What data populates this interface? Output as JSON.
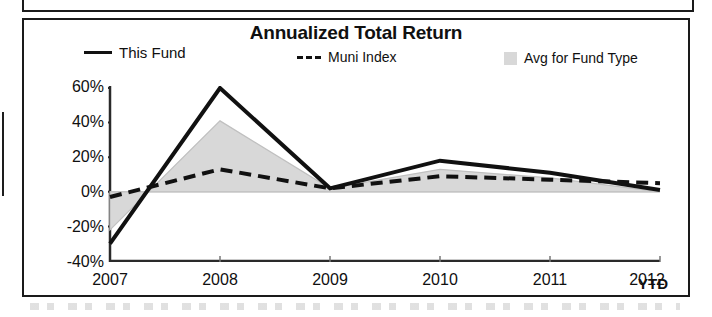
{
  "chart_data": {
    "type": "line",
    "title": "Annualized Total Return",
    "xlabel": "",
    "ylabel": "",
    "categories": [
      "2007",
      "2008",
      "2009",
      "2010",
      "2011",
      "2012"
    ],
    "x_axis_suffix": "YTD",
    "ytick_labels": [
      "60%",
      "40%",
      "20%",
      "0%",
      "-20%",
      "-40%"
    ],
    "ytick_values": [
      60,
      40,
      20,
      0,
      -20,
      -40
    ],
    "ylim": [
      -40,
      60
    ],
    "grid": false,
    "legend_position": "top",
    "series": [
      {
        "name": "This Fund",
        "style": "solid",
        "color": "#111111",
        "values": [
          -30,
          60,
          2,
          18,
          11,
          1
        ]
      },
      {
        "name": "Muni Index",
        "style": "dashed",
        "color": "#111111",
        "values": [
          -3,
          13,
          2,
          9,
          7,
          5
        ]
      },
      {
        "name": "Avg for Fund Type",
        "style": "area",
        "color": "#d8d8d8",
        "values": [
          -22,
          41,
          2,
          13,
          8,
          0
        ]
      }
    ]
  },
  "chart": {
    "title": "Annualized Total Return",
    "legend": {
      "this_fund": "This Fund",
      "muni_index": "Muni Index",
      "avg_for_fund_type": "Avg for Fund Type"
    },
    "y_axis": {
      "t0": "60%",
      "t1": "40%",
      "t2": "20%",
      "t3": "0%",
      "t4": "-20%",
      "t5": "-40%"
    },
    "x_axis": {
      "t0": "2007",
      "t1": "2008",
      "t2": "2009",
      "t3": "2010",
      "t4": "2011",
      "t5": "2012",
      "ytd": "YTD"
    }
  },
  "colors": {
    "line": "#111111",
    "area_fill": "#d8d8d8",
    "border": "#1a1a1a",
    "background": "#ffffff"
  }
}
